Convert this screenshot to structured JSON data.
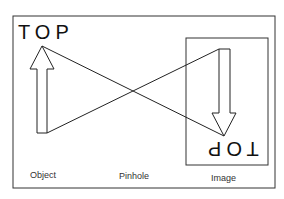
{
  "diagram": {
    "object_text": "TOP",
    "image_text": "TOP",
    "labels": {
      "object": "Object",
      "pinhole": "Pinhole",
      "image": "Image"
    },
    "colors": {
      "stroke": "#222222",
      "background": "#ffffff"
    }
  }
}
